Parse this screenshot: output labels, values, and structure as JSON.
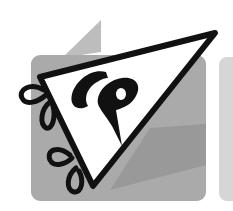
{
  "logo": {
    "monogram": "CP",
    "description": "Pennant flag logo with CP monogram",
    "colors": {
      "background": "#ffffff",
      "panel_main": "#a9a9a9",
      "panel_side": "#d4d4d4",
      "fold": "#bdbdbd",
      "shadow": "#8f8f8f",
      "pennant_fill": "#ffffff",
      "ink": "#111111"
    },
    "icons": [
      "pennant-icon",
      "ribbon-loop-icon"
    ]
  }
}
